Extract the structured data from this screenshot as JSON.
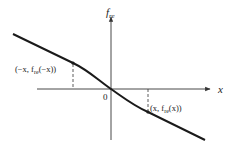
{
  "diagram": {
    "colors": {
      "stroke": "#1a1a1a",
      "axis": "#333333",
      "background": "#ffffff"
    },
    "axes": {
      "y_label": {
        "base": "f",
        "sub": "re"
      },
      "x_label": "x",
      "origin_label": "0"
    },
    "points": [
      {
        "id": "neg",
        "label": "(−x, f",
        "sub": "re",
        "label_end": "(−x))"
      },
      {
        "id": "pos",
        "label": "(x, f",
        "sub": "re",
        "label_end": "(x))"
      }
    ]
  }
}
